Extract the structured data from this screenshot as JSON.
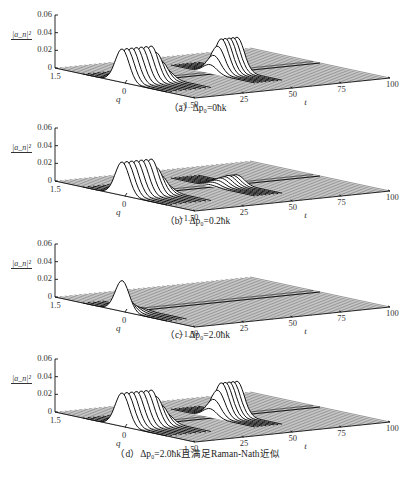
{
  "panels": [
    {
      "id": "a",
      "caption": "（a）Δp₀=0ħk",
      "zticks": [
        "0.06",
        "0.04",
        "0.02",
        "0"
      ],
      "zlabel": "|a_n|²",
      "qlabel": "q",
      "tlabel": "t",
      "qticks": [
        "1.5",
        "0",
        "−1.5"
      ],
      "tticks": [
        "0",
        "25",
        "50",
        "75",
        "100"
      ]
    },
    {
      "id": "b",
      "caption": "（b）Δp₀=0.2ħk",
      "zticks": [
        "0.06",
        "0.04",
        "0.02",
        "0"
      ],
      "zlabel": "|a_n|²",
      "qlabel": "q",
      "tlabel": "t",
      "qticks": [
        "1.5",
        "0",
        "−1.5"
      ],
      "tticks": [
        "0",
        "25",
        "50",
        "75",
        "100"
      ]
    },
    {
      "id": "c",
      "caption": "（c）Δp₀=2.0ħk",
      "zticks": [
        "0.06",
        "0.04",
        "0.02",
        "0"
      ],
      "zlabel": "|a_n|²",
      "qlabel": "q",
      "tlabel": "t",
      "qticks": [
        "1.5",
        "0",
        "−1.5"
      ],
      "tticks": [
        "0",
        "25",
        "50",
        "75",
        "100"
      ]
    },
    {
      "id": "d",
      "caption": "（d）Δp₀=2.0ħk且满足Raman-Nath近似",
      "zticks": [
        "0.06",
        "0.04",
        "0.02",
        "0"
      ],
      "zlabel": "|a_n|²",
      "qlabel": "q",
      "tlabel": "t",
      "qticks": [
        "1.5",
        "0",
        "−1.5"
      ],
      "tticks": [
        "0",
        "25",
        "50",
        "75",
        "100"
      ]
    }
  ],
  "chart_data": [
    {
      "type": "area",
      "title": "（a）Δp₀=0ħk",
      "description": "3D waterfall: |a_n|² vs q and t; wave packet at q≈0 with peaks ~0.04 near early t, decays, then revives near t≈50-60",
      "xlabel": "t",
      "ylabel": "q",
      "zlabel": "|a_n|²",
      "xlim": [
        0,
        100
      ],
      "ylim": [
        -1.5,
        1.5
      ],
      "zlim": [
        0,
        0.06
      ],
      "series": [
        {
          "name": "early packets",
          "t_range": [
            0,
            25
          ],
          "peak": 0.04
        },
        {
          "name": "revival packets",
          "t_range": [
            45,
            60
          ],
          "peak": 0.04
        }
      ]
    },
    {
      "type": "area",
      "title": "（b）Δp₀=0.2ħk",
      "xlabel": "t",
      "ylabel": "q",
      "zlabel": "|a_n|²",
      "xlim": [
        0,
        100
      ],
      "ylim": [
        -1.5,
        1.5
      ],
      "zlim": [
        0,
        0.06
      ],
      "series": [
        {
          "name": "early packets",
          "t_range": [
            0,
            25
          ],
          "peak": 0.04
        },
        {
          "name": "revival packets (weak)",
          "t_range": [
            45,
            60
          ],
          "peak": 0.01
        }
      ]
    },
    {
      "type": "area",
      "title": "（c）Δp₀=2.0ħk",
      "xlabel": "t",
      "ylabel": "q",
      "zlabel": "|a_n|²",
      "xlim": [
        0,
        100
      ],
      "ylim": [
        -1.5,
        1.5
      ],
      "zlim": [
        0,
        0.06
      ],
      "series": [
        {
          "name": "initial packet decaying",
          "t_range": [
            0,
            10
          ],
          "peak": 0.035
        },
        {
          "name": "revival",
          "t_range": [
            45,
            60
          ],
          "peak": 0
        }
      ]
    },
    {
      "type": "area",
      "title": "（d）Δp₀=2.0ħk且满足Raman-Nath近似",
      "xlabel": "t",
      "ylabel": "q",
      "zlabel": "|a_n|²",
      "xlim": [
        0,
        100
      ],
      "ylim": [
        -1.5,
        1.5
      ],
      "zlim": [
        0,
        0.06
      ],
      "series": [
        {
          "name": "early packets",
          "t_range": [
            0,
            25
          ],
          "peak": 0.04
        },
        {
          "name": "revival packets",
          "t_range": [
            45,
            60
          ],
          "peak": 0.04
        }
      ]
    }
  ]
}
